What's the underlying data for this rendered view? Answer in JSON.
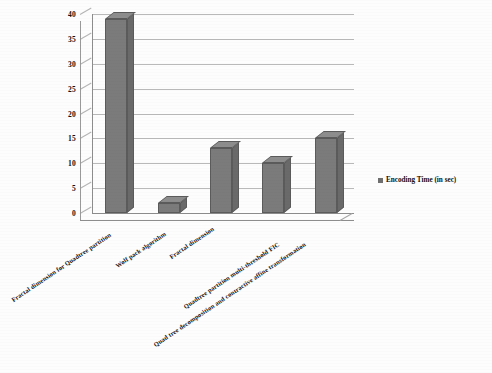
{
  "chart_data": {
    "type": "bar",
    "title": "",
    "subtitle": "",
    "xlabel": "",
    "ylabel": "",
    "ylim": [
      0,
      40
    ],
    "y_ticks": [
      0,
      5,
      10,
      15,
      20,
      25,
      30,
      35,
      40
    ],
    "grid": true,
    "legend_position": "right",
    "categories": [
      "Fractal dimension for Quadtree partition",
      "Wolf pack algorithm",
      "Fractal dimension",
      "Quadtree partition multi-threshold FIC",
      "Quad tree decomposition and contractive affine transformation"
    ],
    "series": [
      {
        "name": "Encoding Time (in sec)",
        "values": [
          39,
          2,
          13,
          10,
          15
        ],
        "color": "#7b7b7b"
      }
    ]
  },
  "legend": {
    "entries": [
      {
        "label": "Encoding Time (in sec)",
        "color": "#6f6f6f"
      }
    ]
  },
  "axis": {
    "y_tick_labels": [
      "40",
      "35",
      "30",
      "25",
      "20",
      "15",
      "10",
      "5",
      "0"
    ]
  },
  "colors": {
    "bar_face": "#7b7b7b",
    "bar_top": "#8d8d8d",
    "bar_side": "#6a6a6a",
    "bar_outline": "#5b5b5b",
    "gridline": "#b9b9b9",
    "axis": "#8d8d8d",
    "background": "#fdfdfd",
    "text": "#141414"
  }
}
